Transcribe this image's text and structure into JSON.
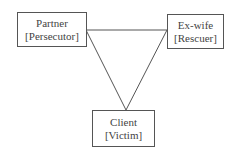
{
  "diagram": {
    "type": "drama-triangle",
    "nodes": [
      {
        "id": "partner",
        "name": "Partner",
        "role": "[Persecutor]"
      },
      {
        "id": "exwife",
        "name": "Ex-wife",
        "role": "[Rescuer]"
      },
      {
        "id": "client",
        "name": "Client",
        "role": "[Victim]"
      }
    ],
    "edges": [
      {
        "from": "partner",
        "to": "exwife"
      },
      {
        "from": "partner",
        "to": "client"
      },
      {
        "from": "exwife",
        "to": "client"
      }
    ],
    "colors": {
      "line": "#555555",
      "text": "#444444",
      "background": "#ffffff"
    }
  }
}
